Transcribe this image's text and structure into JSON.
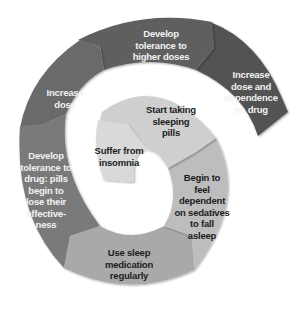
{
  "diagram": {
    "type": "spiral-cycle",
    "direction": "clockwise outward",
    "steps": [
      {
        "order": 1,
        "label": "Suffer from insomnia",
        "fill": "#d9d9d9",
        "text_color": "#1c1c1c"
      },
      {
        "order": 2,
        "label": "Start taking sleeping pills",
        "fill": "#cfcfcf",
        "text_color": "#1c1c1c"
      },
      {
        "order": 3,
        "label": "Begin to feel dependent on sedatives to fall asleep",
        "fill": "#bdbdbd",
        "text_color": "#1c1c1c"
      },
      {
        "order": 4,
        "label": "Use sleep medication regularly",
        "fill": "#a9a9a9",
        "text_color": "#1c1c1c"
      },
      {
        "order": 5,
        "label": "Develop tolerance to drug: pills begin to lose their effective-ness",
        "fill": "#7a7a7a",
        "text_color": "#f2f2f2"
      },
      {
        "order": 6,
        "label": "Increase dose",
        "fill": "#6b6b6b",
        "text_color": "#f2f2f2"
      },
      {
        "order": 7,
        "label": "Develop tolerance to higher doses",
        "fill": "#5e5e5e",
        "text_color": "#f2f2f2"
      },
      {
        "order": 8,
        "label": "Increase dose and dependence on drug",
        "fill": "#525252",
        "text_color": "#f2f2f2"
      }
    ]
  },
  "labels": {
    "s1": [
      "Suffer from",
      "insomnia"
    ],
    "s2": [
      "Start taking",
      "sleeping",
      "pills"
    ],
    "s3": [
      "Begin to",
      "feel",
      "dependent",
      "on sedatives",
      "to fall",
      "asleep"
    ],
    "s4": [
      "Use sleep",
      "medication",
      "regularly"
    ],
    "s5": [
      "Develop",
      "tolerance to",
      "drug: pills",
      "begin to",
      "lose their",
      "effective-",
      "ness"
    ],
    "s6": [
      "Increase",
      "dose"
    ],
    "s7": [
      "Develop",
      "tolerance to",
      "higher doses"
    ],
    "s8": [
      "Increase",
      "dose and",
      "dependence",
      "on drug"
    ]
  }
}
